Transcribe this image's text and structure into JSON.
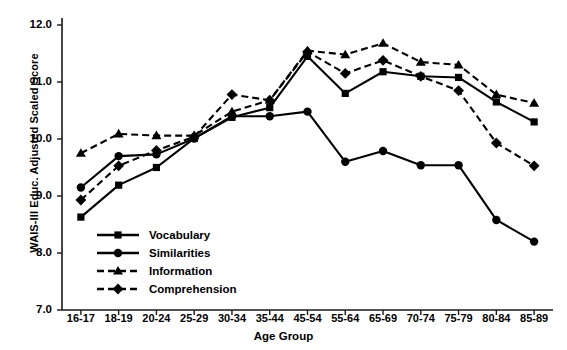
{
  "chart_data": {
    "type": "line",
    "title": "",
    "xlabel": "Age Group",
    "ylabel": "WAIS-III Educ. Adjusted Scaled Score",
    "ylim": [
      7.0,
      12.0
    ],
    "yticks": [
      "12.0",
      "11.0",
      "10.0",
      "9.0",
      "8.0",
      "7.0"
    ],
    "ytick_values": [
      12.0,
      11.0,
      10.0,
      9.0,
      8.0,
      7.0
    ],
    "grid": false,
    "legend_position": "lower-left-inside",
    "categories": [
      "16-17",
      "18-19",
      "20-24",
      "25-29",
      "30-34",
      "35-44",
      "45-54",
      "55-64",
      "65-69",
      "70-74",
      "75-79",
      "80-84",
      "85-89"
    ],
    "series": [
      {
        "name": "Vocabulary",
        "marker": "square",
        "line": "solid",
        "color": "#000000",
        "values": [
          8.63,
          9.19,
          9.5,
          10.01,
          10.38,
          10.55,
          11.45,
          10.8,
          11.18,
          11.1,
          11.08,
          10.65,
          10.3
        ]
      },
      {
        "name": "Similarities",
        "marker": "circle",
        "line": "solid",
        "color": "#000000",
        "values": [
          9.15,
          9.7,
          9.73,
          10.01,
          10.4,
          10.4,
          10.48,
          9.6,
          9.79,
          9.54,
          9.54,
          8.58,
          8.2
        ]
      },
      {
        "name": "Information",
        "marker": "triangle",
        "line": "dashed",
        "color": "#000000",
        "values": [
          9.75,
          10.09,
          10.06,
          10.06,
          10.48,
          10.68,
          11.55,
          11.48,
          11.68,
          11.35,
          11.3,
          10.78,
          10.63
        ]
      },
      {
        "name": "Comprehension",
        "marker": "diamond",
        "line": "dashed",
        "color": "#000000",
        "values": [
          8.93,
          9.53,
          9.8,
          10.04,
          10.78,
          10.68,
          11.53,
          11.15,
          11.38,
          11.1,
          10.85,
          9.93,
          9.53
        ]
      }
    ]
  },
  "legend": {
    "items": [
      {
        "label": "Vocabulary"
      },
      {
        "label": "Similarities"
      },
      {
        "label": "Information"
      },
      {
        "label": "Comprehension"
      }
    ]
  }
}
